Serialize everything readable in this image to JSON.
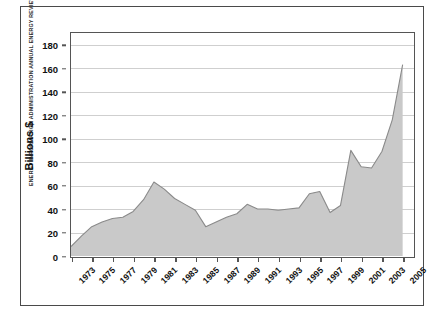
{
  "figure": {
    "source_credit": "ENERGY INFORMATION ADMINISTRATION ANNUAL ENERGY REVIEW 2006"
  },
  "colors": {
    "area_fill": "#c9c9c9",
    "area_stroke": "#8a8a8a",
    "gridline": "#cfcfcf",
    "axis": "#555555",
    "frame": "#4a4a4a",
    "text": "#111111"
  },
  "chart_data": {
    "type": "area",
    "title": "",
    "xlabel": "",
    "ylabel": "Billions $",
    "ylim": [
      0,
      190
    ],
    "xlim": [
      1973,
      2006
    ],
    "grid": true,
    "legend": "none",
    "y_ticks": [
      0,
      20,
      40,
      60,
      80,
      100,
      120,
      140,
      160,
      180
    ],
    "x_tick_labels": [
      "1973",
      "1975",
      "1977",
      "1979",
      "1981",
      "1983",
      "1985",
      "1987",
      "1989",
      "1991",
      "1993",
      "1995",
      "1997",
      "1999",
      "2001",
      "2003",
      "2005"
    ],
    "x": [
      1973,
      1974,
      1975,
      1976,
      1977,
      1978,
      1979,
      1980,
      1981,
      1982,
      1983,
      1984,
      1985,
      1986,
      1987,
      1988,
      1989,
      1990,
      1991,
      1992,
      1993,
      1994,
      1995,
      1996,
      1997,
      1998,
      1999,
      2000,
      2001,
      2002,
      2003,
      2004,
      2005
    ],
    "values": [
      8,
      17,
      25,
      29,
      32,
      33,
      38,
      48,
      63,
      57,
      49,
      44,
      39,
      25,
      29,
      33,
      36,
      44,
      40,
      40,
      39,
      40,
      41,
      53,
      55,
      37,
      43,
      90,
      76,
      75,
      89,
      116,
      163
    ],
    "series": [
      {
        "name": "Value",
        "values": [
          8,
          17,
          25,
          29,
          32,
          33,
          38,
          48,
          63,
          57,
          49,
          44,
          39,
          25,
          29,
          33,
          36,
          44,
          40,
          40,
          39,
          40,
          41,
          53,
          55,
          37,
          43,
          90,
          76,
          75,
          89,
          116,
          163
        ]
      }
    ]
  }
}
